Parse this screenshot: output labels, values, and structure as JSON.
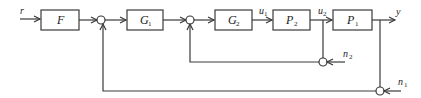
{
  "diagram": {
    "type": "block-diagram",
    "blocks": {
      "F": {
        "label": "F",
        "sub": ""
      },
      "G1": {
        "label": "G",
        "sub": "1"
      },
      "G2": {
        "label": "G",
        "sub": "2"
      },
      "P2": {
        "label": "P",
        "sub": "2"
      },
      "P1": {
        "label": "P",
        "sub": "1"
      }
    },
    "signals": {
      "r": {
        "label": "r",
        "sub": ""
      },
      "u1": {
        "label": "u",
        "sub": "1"
      },
      "u2": {
        "label": "u",
        "sub": "2"
      },
      "y": {
        "label": "y",
        "sub": ""
      },
      "n2": {
        "label": "n",
        "sub": "2"
      },
      "n1": {
        "label": "n",
        "sub": "1"
      }
    },
    "connections": [
      [
        "r",
        "F"
      ],
      [
        "F",
        "sum1"
      ],
      [
        "sum1",
        "G1"
      ],
      [
        "G1",
        "sum2"
      ],
      [
        "sum2",
        "G2"
      ],
      [
        "G2",
        "P2"
      ],
      [
        "P2",
        "P1"
      ],
      [
        "P1",
        "y"
      ],
      [
        "u2",
        "sum_n2"
      ],
      [
        "n2",
        "sum_n2"
      ],
      [
        "sum_n2",
        "sum2"
      ],
      [
        "y",
        "sum_n1"
      ],
      [
        "n1",
        "sum_n1"
      ],
      [
        "sum_n1",
        "sum1"
      ]
    ]
  }
}
